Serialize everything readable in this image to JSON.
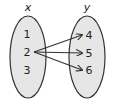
{
  "diagram": {
    "type": "mapping",
    "domain_set": {
      "label": "x",
      "elements": [
        "1",
        "2",
        "3"
      ]
    },
    "codomain_set": {
      "label": "y",
      "elements": [
        "4",
        "5",
        "6"
      ]
    },
    "mappings": [
      {
        "from": "2",
        "to": "4"
      },
      {
        "from": "2",
        "to": "5"
      },
      {
        "from": "2",
        "to": "6"
      }
    ],
    "colors": {
      "oval_fill": "#e6e6e6",
      "stroke": "#333333",
      "text": "#222222"
    }
  }
}
